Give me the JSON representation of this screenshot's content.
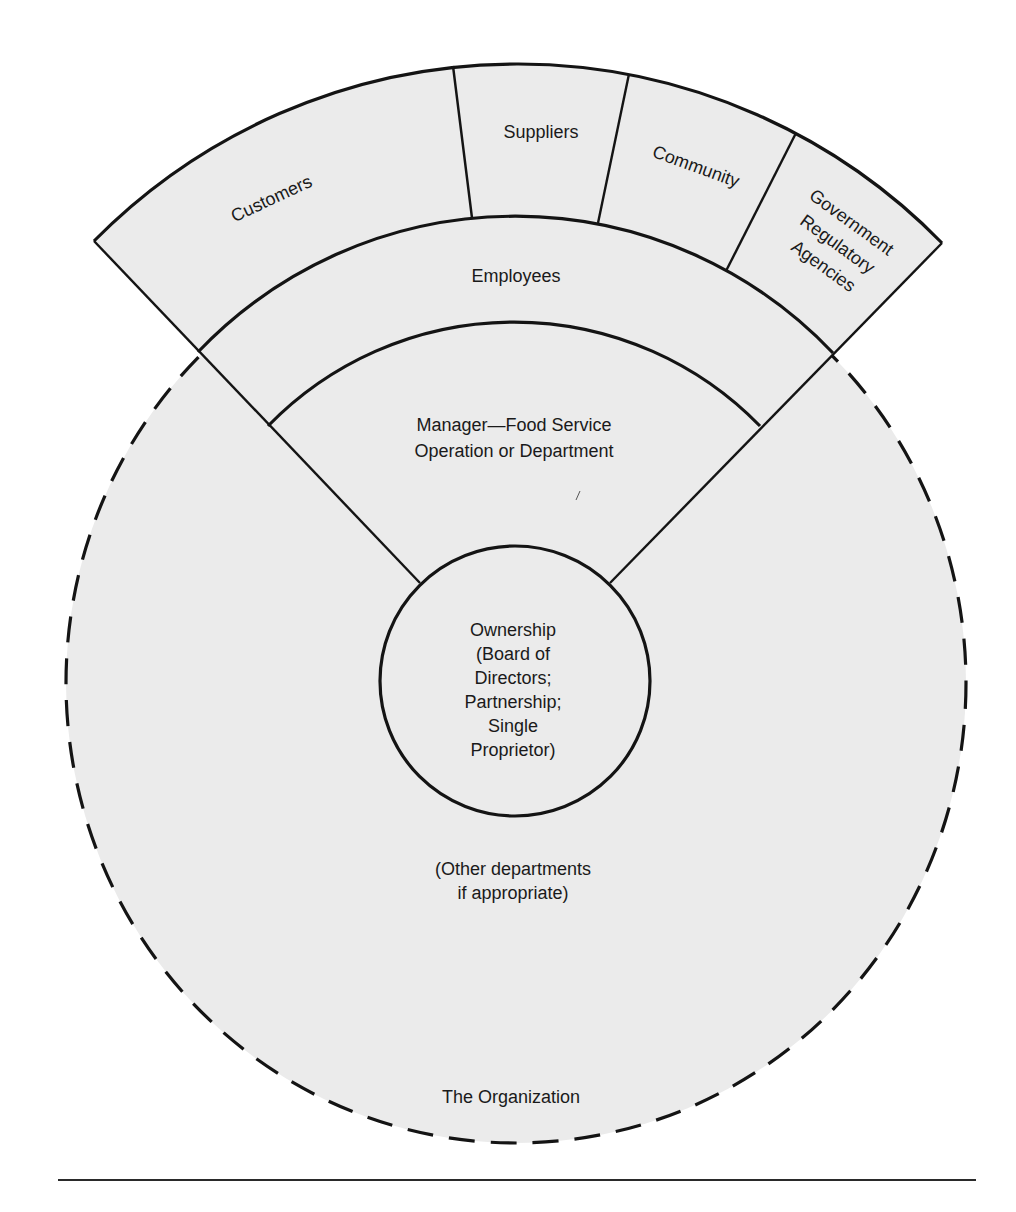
{
  "diagram": {
    "type": "stakeholder-wedge-diagram",
    "outer_segments": [
      {
        "label": "Customers"
      },
      {
        "label": "Suppliers"
      },
      {
        "label": "Community"
      },
      {
        "label": "Government Regulatory Agencies",
        "lines": [
          "Government",
          "Regulatory",
          "Agencies"
        ]
      }
    ],
    "employees": {
      "label": "Employees"
    },
    "manager": {
      "lines": [
        "Manager—Food Service",
        "Operation or Department"
      ]
    },
    "ownership": {
      "lines": [
        "Ownership",
        "(Board of",
        "Directors;",
        "Partnership;",
        "Single",
        "Proprietor)"
      ]
    },
    "other_departments": {
      "lines": [
        "(Other departments",
        "if appropriate)"
      ]
    },
    "organization": {
      "label": "The Organization"
    },
    "colors": {
      "fill": "#ebebeb",
      "line": "#141414",
      "background": "#ffffff"
    }
  }
}
